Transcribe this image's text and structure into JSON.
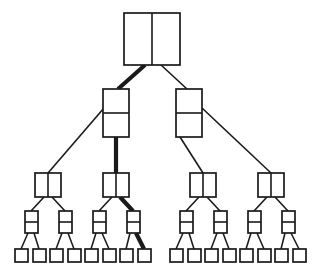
{
  "diagram": {
    "type": "tree",
    "background_color": "#ffffff",
    "stroke_color": "#1a1a1a",
    "highlight_color": "#1a1a1a",
    "levels": 5,
    "node_counts": [
      1,
      2,
      4,
      8,
      16
    ],
    "total_nodes": 31,
    "canvas": {
      "width": 321,
      "height": 273
    }
  },
  "node_styles": {
    "root": {
      "split": "vertical",
      "width": 56,
      "height": 52,
      "stroke_width": 1.7
    },
    "level2": {
      "split": "horizontal",
      "width": 26,
      "height": 48,
      "stroke_width": 1.7
    },
    "level3": {
      "split": "vertical",
      "width": 26,
      "height": 24,
      "stroke_width": 1.7
    },
    "level4": {
      "split": "horizontal",
      "width": 13,
      "height": 22,
      "stroke_width": 1.7
    },
    "leaf": {
      "split": "none",
      "width": 13,
      "height": 13,
      "stroke_width": 1.7
    }
  },
  "edge_styles": {
    "normal_width": 1.6,
    "bold_width": 4.2,
    "bold_label": "highlighted-path"
  },
  "nodes": {
    "root": {
      "id": "n0",
      "label": "root-node",
      "cx": 152,
      "cy": 39,
      "x": 124,
      "y": 13,
      "w": 56,
      "h": 52,
      "split": "vertical"
    },
    "level2": [
      {
        "id": "n1",
        "label": "level2-node-left",
        "cx": 116,
        "cy": 113,
        "x": 103,
        "y": 89,
        "w": 26,
        "h": 48,
        "split": "horizontal"
      },
      {
        "id": "n2",
        "label": "level2-node-right",
        "cx": 189,
        "cy": 113,
        "x": 176,
        "y": 89,
        "w": 26,
        "h": 48,
        "split": "horizontal"
      }
    ],
    "level3": [
      {
        "id": "n3",
        "label": "level3-node-1",
        "cx": 48,
        "cy": 185,
        "x": 35,
        "y": 173,
        "w": 26,
        "h": 24,
        "split": "vertical"
      },
      {
        "id": "n4",
        "label": "level3-node-2",
        "cx": 116,
        "cy": 185,
        "x": 103,
        "y": 173,
        "w": 26,
        "h": 24,
        "split": "vertical"
      },
      {
        "id": "n5",
        "label": "level3-node-3",
        "cx": 203,
        "cy": 185,
        "x": 190,
        "y": 173,
        "w": 26,
        "h": 24,
        "split": "vertical"
      },
      {
        "id": "n6",
        "label": "level3-node-4",
        "cx": 271,
        "cy": 185,
        "x": 258,
        "y": 173,
        "w": 26,
        "h": 24,
        "split": "vertical"
      }
    ],
    "level4": [
      {
        "id": "n7",
        "label": "level4-node-1",
        "cx": 31,
        "cy": 222,
        "x": 25,
        "y": 211,
        "w": 13,
        "h": 22,
        "split": "horizontal"
      },
      {
        "id": "n8",
        "label": "level4-node-2",
        "cx": 65,
        "cy": 222,
        "x": 59,
        "y": 211,
        "w": 13,
        "h": 22,
        "split": "horizontal"
      },
      {
        "id": "n9",
        "label": "level4-node-3",
        "cx": 99,
        "cy": 222,
        "x": 93,
        "y": 211,
        "w": 13,
        "h": 22,
        "split": "horizontal"
      },
      {
        "id": "n10",
        "label": "level4-node-4",
        "cx": 133,
        "cy": 222,
        "x": 127,
        "y": 211,
        "w": 13,
        "h": 22,
        "split": "horizontal"
      },
      {
        "id": "n11",
        "label": "level4-node-5",
        "cx": 186,
        "cy": 222,
        "x": 180,
        "y": 211,
        "w": 13,
        "h": 22,
        "split": "horizontal"
      },
      {
        "id": "n12",
        "label": "level4-node-6",
        "cx": 220,
        "cy": 222,
        "x": 214,
        "y": 211,
        "w": 13,
        "h": 22,
        "split": "horizontal"
      },
      {
        "id": "n13",
        "label": "level4-node-7",
        "cx": 254,
        "cy": 222,
        "x": 248,
        "y": 211,
        "w": 13,
        "h": 22,
        "split": "horizontal"
      },
      {
        "id": "n14",
        "label": "level4-node-8",
        "cx": 288,
        "cy": 222,
        "x": 282,
        "y": 211,
        "w": 13,
        "h": 22,
        "split": "horizontal"
      }
    ],
    "leaves": [
      {
        "id": "l1",
        "label": "leaf-node-1",
        "cx": 21,
        "cy": 256,
        "x": 15,
        "y": 249,
        "w": 13,
        "h": 13
      },
      {
        "id": "l2",
        "label": "leaf-node-2",
        "cx": 39,
        "cy": 256,
        "x": 33,
        "y": 249,
        "w": 13,
        "h": 13
      },
      {
        "id": "l3",
        "label": "leaf-node-3",
        "cx": 56,
        "cy": 256,
        "x": 50,
        "y": 249,
        "w": 13,
        "h": 13
      },
      {
        "id": "l4",
        "label": "leaf-node-4",
        "cx": 74,
        "cy": 256,
        "x": 68,
        "y": 249,
        "w": 13,
        "h": 13
      },
      {
        "id": "l5",
        "label": "leaf-node-5",
        "cx": 91,
        "cy": 256,
        "x": 85,
        "y": 249,
        "w": 13,
        "h": 13
      },
      {
        "id": "l6",
        "label": "leaf-node-6",
        "cx": 109,
        "cy": 256,
        "x": 103,
        "y": 249,
        "w": 13,
        "h": 13
      },
      {
        "id": "l7",
        "label": "leaf-node-7",
        "cx": 126,
        "cy": 256,
        "x": 120,
        "y": 249,
        "w": 13,
        "h": 13
      },
      {
        "id": "l8",
        "label": "leaf-node-8",
        "cx": 144,
        "cy": 256,
        "x": 138,
        "y": 249,
        "w": 13,
        "h": 13
      },
      {
        "id": "l9",
        "label": "leaf-node-9",
        "cx": 176,
        "cy": 256,
        "x": 170,
        "y": 249,
        "w": 13,
        "h": 13
      },
      {
        "id": "l10",
        "label": "leaf-node-10",
        "cx": 194,
        "cy": 256,
        "x": 188,
        "y": 249,
        "w": 13,
        "h": 13
      },
      {
        "id": "l11",
        "label": "leaf-node-11",
        "cx": 211,
        "cy": 256,
        "x": 205,
        "y": 249,
        "w": 13,
        "h": 13
      },
      {
        "id": "l12",
        "label": "leaf-node-12",
        "cx": 229,
        "cy": 256,
        "x": 223,
        "y": 249,
        "w": 13,
        "h": 13
      },
      {
        "id": "l13",
        "label": "leaf-node-13",
        "cx": 246,
        "cy": 256,
        "x": 240,
        "y": 249,
        "w": 13,
        "h": 13
      },
      {
        "id": "l14",
        "label": "leaf-node-14",
        "cx": 264,
        "cy": 256,
        "x": 258,
        "y": 249,
        "w": 13,
        "h": 13
      },
      {
        "id": "l15",
        "label": "leaf-node-15",
        "cx": 281,
        "cy": 256,
        "x": 275,
        "y": 249,
        "w": 13,
        "h": 13
      },
      {
        "id": "l16",
        "label": "leaf-node-16",
        "cx": 299,
        "cy": 256,
        "x": 293,
        "y": 249,
        "w": 13,
        "h": 13
      }
    ]
  },
  "edges": [
    {
      "id": "e1",
      "label": "edge-root-to-level2-left",
      "x1": 145,
      "y1": 65,
      "x2": 118,
      "y2": 89,
      "bold": true
    },
    {
      "id": "e2",
      "label": "edge-root-to-level2-right",
      "x1": 161,
      "y1": 65,
      "x2": 187,
      "y2": 89,
      "bold": false
    },
    {
      "id": "e3",
      "label": "edge-level2left-to-level3-1",
      "x1": 104,
      "y1": 108,
      "x2": 48,
      "y2": 173,
      "bold": false
    },
    {
      "id": "e4",
      "label": "edge-level2left-to-level3-2",
      "x1": 116,
      "y1": 137,
      "x2": 116,
      "y2": 173,
      "bold": true
    },
    {
      "id": "e5",
      "label": "edge-level2right-to-level3-3",
      "x1": 180,
      "y1": 137,
      "x2": 203,
      "y2": 173,
      "bold": false
    },
    {
      "id": "e6",
      "label": "edge-level2right-to-level3-4",
      "x1": 202,
      "y1": 108,
      "x2": 271,
      "y2": 173,
      "bold": false
    },
    {
      "id": "e7",
      "label": "edge-level3-1-to-level4-1",
      "x1": 44,
      "y1": 197,
      "x2": 31,
      "y2": 211,
      "bold": false
    },
    {
      "id": "e8",
      "label": "edge-level3-1-to-level4-2",
      "x1": 52,
      "y1": 197,
      "x2": 65,
      "y2": 211,
      "bold": false
    },
    {
      "id": "e9",
      "label": "edge-level3-2-to-level4-3",
      "x1": 112,
      "y1": 197,
      "x2": 99,
      "y2": 211,
      "bold": false
    },
    {
      "id": "e10",
      "label": "edge-level3-2-to-level4-4",
      "x1": 120,
      "y1": 197,
      "x2": 133,
      "y2": 211,
      "bold": true
    },
    {
      "id": "e11",
      "label": "edge-level3-3-to-level4-5",
      "x1": 199,
      "y1": 197,
      "x2": 186,
      "y2": 211,
      "bold": false
    },
    {
      "id": "e12",
      "label": "edge-level3-3-to-level4-6",
      "x1": 207,
      "y1": 197,
      "x2": 220,
      "y2": 211,
      "bold": false
    },
    {
      "id": "e13",
      "label": "edge-level3-4-to-level4-7",
      "x1": 267,
      "y1": 197,
      "x2": 254,
      "y2": 211,
      "bold": false
    },
    {
      "id": "e14",
      "label": "edge-level3-4-to-level4-8",
      "x1": 275,
      "y1": 197,
      "x2": 288,
      "y2": 211,
      "bold": false
    },
    {
      "id": "e15",
      "label": "edge-level4-1-to-leaf-1",
      "x1": 28,
      "y1": 233,
      "x2": 21,
      "y2": 249,
      "bold": false
    },
    {
      "id": "e16",
      "label": "edge-level4-1-to-leaf-2",
      "x1": 34,
      "y1": 233,
      "x2": 39,
      "y2": 249,
      "bold": false
    },
    {
      "id": "e17",
      "label": "edge-level4-2-to-leaf-3",
      "x1": 62,
      "y1": 233,
      "x2": 56,
      "y2": 249,
      "bold": false
    },
    {
      "id": "e18",
      "label": "edge-level4-2-to-leaf-4",
      "x1": 68,
      "y1": 233,
      "x2": 74,
      "y2": 249,
      "bold": false
    },
    {
      "id": "e19",
      "label": "edge-level4-3-to-leaf-5",
      "x1": 96,
      "y1": 233,
      "x2": 91,
      "y2": 249,
      "bold": false
    },
    {
      "id": "e20",
      "label": "edge-level4-3-to-leaf-6",
      "x1": 102,
      "y1": 233,
      "x2": 109,
      "y2": 249,
      "bold": false
    },
    {
      "id": "e21",
      "label": "edge-level4-4-to-leaf-7",
      "x1": 130,
      "y1": 233,
      "x2": 126,
      "y2": 249,
      "bold": false
    },
    {
      "id": "e22",
      "label": "edge-level4-4-to-leaf-8",
      "x1": 136,
      "y1": 233,
      "x2": 144,
      "y2": 249,
      "bold": true
    },
    {
      "id": "e23",
      "label": "edge-level4-5-to-leaf-9",
      "x1": 183,
      "y1": 233,
      "x2": 176,
      "y2": 249,
      "bold": false
    },
    {
      "id": "e24",
      "label": "edge-level4-5-to-leaf-10",
      "x1": 189,
      "y1": 233,
      "x2": 194,
      "y2": 249,
      "bold": false
    },
    {
      "id": "e25",
      "label": "edge-level4-6-to-leaf-11",
      "x1": 217,
      "y1": 233,
      "x2": 211,
      "y2": 249,
      "bold": false
    },
    {
      "id": "e26",
      "label": "edge-level4-6-to-leaf-12",
      "x1": 223,
      "y1": 233,
      "x2": 229,
      "y2": 249,
      "bold": false
    },
    {
      "id": "e27",
      "label": "edge-level4-7-to-leaf-13",
      "x1": 251,
      "y1": 233,
      "x2": 246,
      "y2": 249,
      "bold": false
    },
    {
      "id": "e28",
      "label": "edge-level4-7-to-leaf-14",
      "x1": 257,
      "y1": 233,
      "x2": 264,
      "y2": 249,
      "bold": false
    },
    {
      "id": "e29",
      "label": "edge-level4-8-to-leaf-15",
      "x1": 285,
      "y1": 233,
      "x2": 281,
      "y2": 249,
      "bold": false
    },
    {
      "id": "e30",
      "label": "edge-level4-8-to-leaf-16",
      "x1": 291,
      "y1": 233,
      "x2": 299,
      "y2": 249,
      "bold": false
    }
  ],
  "highlighted_path": {
    "label": "highlighted-path",
    "node_sequence": [
      "n0",
      "n1",
      "n4",
      "n10",
      "l8"
    ],
    "edge_sequence": [
      "e1",
      "e4",
      "e10",
      "e22"
    ]
  }
}
